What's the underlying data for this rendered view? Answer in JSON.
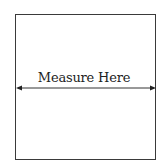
{
  "diagram": {
    "label": "Measure Here",
    "stroke_color": "#3a3a3a",
    "arrow": {
      "type": "double-headed",
      "orientation": "horizontal"
    }
  }
}
